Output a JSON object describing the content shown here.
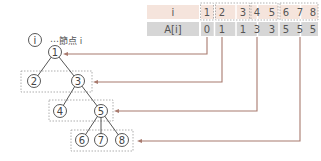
{
  "colors": {
    "header_row_bg": "#f5e4dc",
    "value_row_bg": "#d6d6d6",
    "arrow": "#a87a6e",
    "tree_line": "#444444",
    "dashed_box": "#999999"
  },
  "legend": {
    "symbol": "i",
    "label": "⋯節点 i"
  },
  "table": {
    "row_labels": [
      "i",
      "A[i]"
    ],
    "index": [
      "1",
      "2",
      "3",
      "4",
      "5",
      "6",
      "7",
      "8"
    ],
    "values": [
      "0",
      "1",
      "1",
      "3",
      "3",
      "5",
      "5",
      "5"
    ],
    "groups": [
      [
        1
      ],
      [
        2,
        3
      ],
      [
        4,
        5
      ],
      [
        6,
        7,
        8
      ]
    ]
  },
  "tree": {
    "nodes": [
      {
        "id": "1",
        "label": "1"
      },
      {
        "id": "2",
        "label": "2"
      },
      {
        "id": "3",
        "label": "3"
      },
      {
        "id": "4",
        "label": "4"
      },
      {
        "id": "5",
        "label": "5"
      },
      {
        "id": "6",
        "label": "6"
      },
      {
        "id": "7",
        "label": "7"
      },
      {
        "id": "8",
        "label": "8"
      }
    ],
    "edges": [
      [
        "1",
        "2"
      ],
      [
        "1",
        "3"
      ],
      [
        "3",
        "4"
      ],
      [
        "3",
        "5"
      ],
      [
        "5",
        "6"
      ],
      [
        "5",
        "7"
      ],
      [
        "5",
        "8"
      ]
    ],
    "levels": [
      [
        "1"
      ],
      [
        "2",
        "3"
      ],
      [
        "4",
        "5"
      ],
      [
        "6",
        "7",
        "8"
      ]
    ]
  },
  "arrows": [
    {
      "from_index": "1",
      "value": "0",
      "to": "node 1"
    },
    {
      "from_index": "2",
      "value": "1",
      "to": "group 2-3"
    },
    {
      "from_index": "4",
      "value": "3",
      "to": "group 4-5"
    },
    {
      "from_index": "7",
      "value": "5",
      "to": "group 6-8"
    }
  ]
}
